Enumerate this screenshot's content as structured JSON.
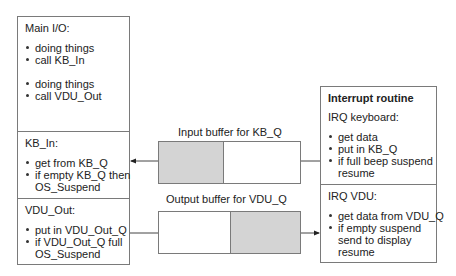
{
  "main_io": {
    "title": "Main I/O:",
    "group1": [
      "doing things",
      "call KB_In"
    ],
    "group2": [
      "doing things",
      "call VDU_Out"
    ]
  },
  "kb_in": {
    "title": "KB_In:",
    "items": [
      "get from KB_Q",
      "if empty KB_Q then"
    ],
    "continuation": "OS_Suspend"
  },
  "vdu_out": {
    "title": "VDU_Out:",
    "items": [
      "put in VDU_Out_Q",
      "if VDU_Out_Q full"
    ],
    "continuation": "OS_Suspend"
  },
  "interrupt": {
    "title": "Interrupt routine",
    "irq_keyboard": {
      "title": "IRQ keyboard:",
      "items": [
        "get data",
        "put in KB_Q",
        "if full beep suspend"
      ],
      "continuation": "resume"
    },
    "irq_vdu": {
      "title": "IRQ VDU:",
      "items": [
        "get data from VDU_Q",
        "if empty suspend"
      ],
      "continuation1": "send to display",
      "continuation2": "resume"
    }
  },
  "buffers": {
    "input_label": "Input buffer for KB_Q",
    "output_label": "Output buffer for VDU_Q"
  },
  "colors": {
    "border": "#7a7a7a",
    "buffer_fill": "#d4d4d4",
    "text": "#222222"
  }
}
